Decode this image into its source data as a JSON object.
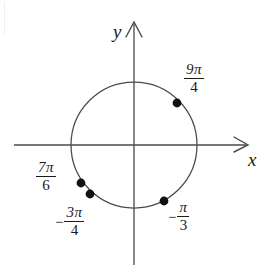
{
  "figure": {
    "background_color": "#ffffff",
    "stroke_color": "#4a4a4a",
    "point_color": "#111111",
    "axes": {
      "x_axis_label": "x",
      "y_axis_label": "y",
      "x_axis_y_px": 145,
      "y_axis_x_px": 134
    },
    "circle": {
      "center_px": [
        134,
        145
      ],
      "radius_px": 63
    },
    "points": [
      {
        "name": "point-9pi-over-4",
        "label_numerator": "9π",
        "label_denominator": "4",
        "sign": "",
        "angle_radians_expression": "9π/4",
        "angle_degrees": 405,
        "point_px": [
          177,
          103
        ],
        "label_px": [
          183,
          62
        ]
      },
      {
        "name": "point-7pi-over-6",
        "label_numerator": "7π",
        "label_denominator": "6",
        "sign": "",
        "angle_radians_expression": "7π/6",
        "angle_degrees": 210,
        "point_px": [
          81,
          183
        ],
        "label_px": [
          35,
          160
        ]
      },
      {
        "name": "point-negative-3pi-over-4",
        "label_numerator": "3π",
        "label_denominator": "4",
        "sign": "−",
        "angle_radians_expression": "−3π/4",
        "angle_degrees": -135,
        "point_px": [
          90,
          194
        ],
        "label_px": [
          55,
          205
        ]
      },
      {
        "name": "point-negative-pi-over-3",
        "label_numerator": "π",
        "label_denominator": "3",
        "sign": "−",
        "angle_radians_expression": "−π/3",
        "angle_degrees": -60,
        "point_px": [
          164,
          201
        ],
        "label_px": [
          168,
          200
        ]
      }
    ]
  }
}
